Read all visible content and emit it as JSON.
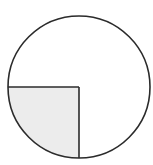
{
  "diagram": {
    "type": "fraction-circle",
    "total_parts": 4,
    "shaded_parts": 1,
    "shaded_quadrant": "bottom-left",
    "fraction_shaded": "1/4",
    "center": [
      79,
      87
    ],
    "radius": 71,
    "colors": {
      "stroke": "#2b2b2b",
      "shaded_fill": "#ececec",
      "unshaded_fill": "#ffffff"
    }
  }
}
